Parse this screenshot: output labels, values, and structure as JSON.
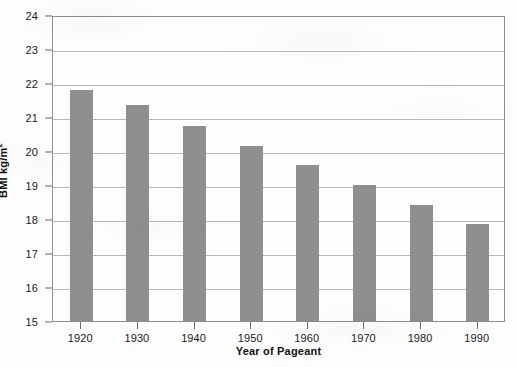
{
  "chart_data": {
    "type": "bar",
    "title": "",
    "xlabel": "Year of Pageant",
    "ylabel": "BMI kg/m²",
    "ylabel_base": "BMI kg/m",
    "ylabel_sup": "2",
    "categories": [
      "1920",
      "1930",
      "1940",
      "1950",
      "1960",
      "1970",
      "1980",
      "1990"
    ],
    "values": [
      21.8,
      21.35,
      20.75,
      20.15,
      19.6,
      19.0,
      18.4,
      17.85
    ],
    "ylim": [
      15,
      24
    ],
    "ytick_labels": [
      "24",
      "23",
      "22",
      "21",
      "20",
      "19",
      "18",
      "17",
      "16",
      "15"
    ],
    "ytick_values": [
      24,
      23,
      22,
      21,
      20,
      19,
      18,
      17,
      16,
      15
    ],
    "grid": true,
    "legend": "none",
    "bar_color": "#8f8f8f",
    "frame_color": "#8e8e8e",
    "gridline_color": "#b9b9b9",
    "background_color": "#fefefe",
    "text_color": "#1a1a1a"
  }
}
